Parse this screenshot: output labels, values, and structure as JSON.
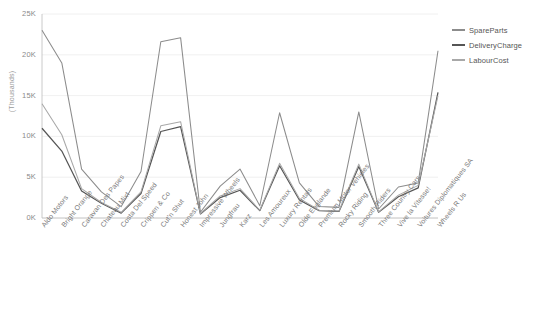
{
  "chart_data": {
    "type": "line",
    "title": "",
    "xlabel": "",
    "ylabel": "(Thousands)",
    "ylim": [
      0,
      25000
    ],
    "ytick_labels": [
      "0K",
      "5K",
      "10K",
      "15K",
      "20K",
      "25K"
    ],
    "ytick_values": [
      0,
      5000,
      10000,
      15000,
      20000,
      25000
    ],
    "grid": true,
    "legend_position": "right",
    "categories": [
      "Aldo Motors",
      "Bright Orange",
      "Caravan Des Papes",
      "Chateau Mixt",
      "Costa Del Speed",
      "Crippen & Co",
      "Cut'n Shut",
      "Honest John",
      "Impressive Wheels",
      "Jungfrau",
      "Karz",
      "Les Amoureux",
      "Luxury Rentals",
      "Olde Englande",
      "Premium Motor Vehicles",
      "Rocky Riding",
      "Smooth Riders",
      "Three Country Cars",
      "Vive la Vitesse!",
      "Voitures Diplomatiques SA",
      "Wheels R Us"
    ],
    "series": [
      {
        "name": "SpareParts",
        "color": "#8c8c8c",
        "values": [
          23000,
          19000,
          6000,
          3200,
          1400,
          5700,
          21600,
          22100,
          700,
          3900,
          6000,
          1500,
          12900,
          4300,
          1400,
          1300,
          13000,
          1100,
          3800,
          4300,
          20500
        ]
      },
      {
        "name": "DeliveryCharge",
        "color": "#555555",
        "values": [
          11000,
          8200,
          3300,
          1800,
          600,
          3000,
          10600,
          11200,
          500,
          2500,
          3400,
          900,
          6400,
          2200,
          900,
          800,
          6300,
          700,
          2600,
          3700,
          15400
        ]
      },
      {
        "name": "LabourCost",
        "color": "#a8a8a8",
        "values": [
          14000,
          10200,
          3600,
          1900,
          700,
          3200,
          11300,
          11800,
          550,
          2700,
          3600,
          950,
          6700,
          2400,
          950,
          850,
          6600,
          750,
          2800,
          4000,
          15000
        ]
      }
    ]
  },
  "legend": {
    "items": [
      {
        "label": "SpareParts"
      },
      {
        "label": "DeliveryCharge"
      },
      {
        "label": "LabourCost"
      }
    ]
  }
}
